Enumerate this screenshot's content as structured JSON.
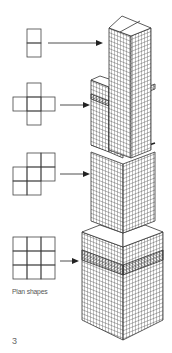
{
  "figure": {
    "caption": "Plan shapes",
    "figure_number": "3",
    "line_color": "#333333",
    "background": "#ffffff"
  },
  "plan_shapes": [
    {
      "name": "two-square-column",
      "cells": [
        [
          0,
          0
        ],
        [
          0,
          1
        ]
      ],
      "stage": "top"
    },
    {
      "name": "cross",
      "cells": [
        [
          1,
          0
        ],
        [
          0,
          1
        ],
        [
          1,
          1
        ],
        [
          2,
          1
        ],
        [
          1,
          2
        ]
      ],
      "stage": "upper-middle"
    },
    {
      "name": "notched-square",
      "cells": [
        [
          1,
          0
        ],
        [
          2,
          0
        ],
        [
          0,
          1
        ],
        [
          1,
          1
        ],
        [
          2,
          1
        ],
        [
          0,
          2
        ],
        [
          1,
          2
        ]
      ],
      "stage": "lower-middle"
    },
    {
      "name": "full-square",
      "cells": [
        [
          0,
          0
        ],
        [
          1,
          0
        ],
        [
          2,
          0
        ],
        [
          0,
          1
        ],
        [
          1,
          1
        ],
        [
          2,
          1
        ],
        [
          0,
          2
        ],
        [
          1,
          2
        ],
        [
          2,
          2
        ]
      ],
      "stage": "base"
    }
  ]
}
